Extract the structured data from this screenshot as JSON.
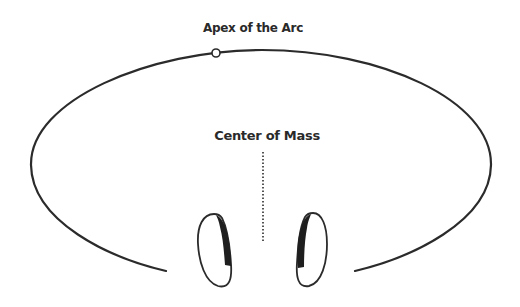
{
  "diagram": {
    "labels": {
      "apex": "Apex of the Arc",
      "center_of_mass": "Center of Mass"
    },
    "colors": {
      "stroke": "#2b2b2b",
      "background": "#ffffff",
      "foot_shade": "#1e1e1e"
    },
    "elements": {
      "arc": "open elliptical arc passing over the top, opening at the bottom",
      "apex_marker": "small hollow circle on the arc",
      "center_line": "vertical dotted line below Center of Mass label",
      "feet": [
        "left footprint",
        "right footprint"
      ]
    }
  }
}
